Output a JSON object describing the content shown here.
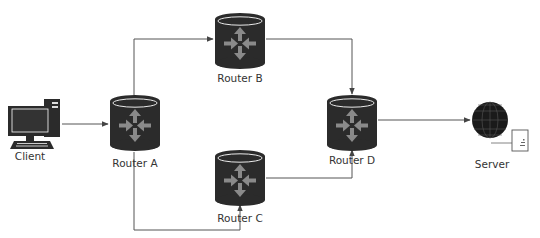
{
  "diagram": {
    "type": "network-topology",
    "nodes": [
      {
        "id": "client",
        "label": "Client",
        "icon": "desktop-computer-icon"
      },
      {
        "id": "router_a",
        "label": "Router A",
        "icon": "router-icon"
      },
      {
        "id": "router_b",
        "label": "Router B",
        "icon": "router-icon"
      },
      {
        "id": "router_c",
        "label": "Router C",
        "icon": "router-icon"
      },
      {
        "id": "router_d",
        "label": "Router D",
        "icon": "router-icon"
      },
      {
        "id": "server",
        "label": "Server",
        "icon": "globe-server-icon"
      }
    ],
    "edges": [
      {
        "from": "client",
        "to": "router_a"
      },
      {
        "from": "router_a",
        "to": "router_b"
      },
      {
        "from": "router_b",
        "to": "router_d"
      },
      {
        "from": "router_a",
        "to": "router_c"
      },
      {
        "from": "router_c",
        "to": "router_d"
      },
      {
        "from": "router_d",
        "to": "server"
      }
    ],
    "colors": {
      "router_body": "#2b2b2b",
      "router_arrows": "#8a8a8a",
      "line": "#555555",
      "label": "#333333"
    }
  }
}
